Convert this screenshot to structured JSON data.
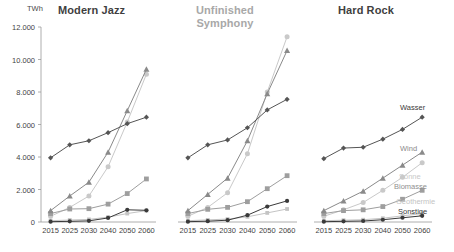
{
  "figure": {
    "unit_label": "TWh",
    "panels": [
      {
        "title": "Modern Jazz",
        "title_color": "#3f3f3f"
      },
      {
        "title": "Unfinished Symphony",
        "title_color": "#a8a8a8"
      },
      {
        "title": "Hard Rock",
        "title_color": "#3f3f3f"
      }
    ]
  },
  "legend": {
    "position": "right-inside",
    "entries": [
      {
        "label": "Wasser",
        "color": "#555555",
        "marker": "diamond"
      },
      {
        "label": "Wind",
        "color": "#8a8a8a",
        "marker": "triangle"
      },
      {
        "label": "Sonne",
        "color": "#c9c9c9",
        "marker": "circle"
      },
      {
        "label": "Biomasse",
        "color": "#9e9e9e",
        "marker": "square"
      },
      {
        "label": "Geothermie",
        "color": "#c4c4c4",
        "marker": "square-small"
      },
      {
        "label": "Sonstige",
        "color": "#3a3a3a",
        "marker": "circle-small"
      }
    ]
  },
  "chart_data": [
    {
      "type": "line",
      "title": "Modern Jazz",
      "xlabel": "",
      "ylabel": "TWh",
      "ylim": [
        0,
        12000
      ],
      "yticks": [
        0,
        2000,
        4000,
        6000,
        8000,
        10000,
        12000
      ],
      "ytick_labels": [
        "0",
        "2.000",
        "4.000",
        "6.000",
        "8.000",
        "10.000",
        "12.000"
      ],
      "categories": [
        "2015",
        "2025",
        "2030",
        "2040",
        "2050",
        "2060"
      ],
      "grid": false,
      "series": [
        {
          "name": "Wasser",
          "values": [
            3950,
            4750,
            5000,
            5500,
            6050,
            6450
          ]
        },
        {
          "name": "Wind",
          "values": [
            700,
            1600,
            2450,
            4300,
            6850,
            9400
          ]
        },
        {
          "name": "Sonne",
          "values": [
            350,
            900,
            1600,
            3400,
            6150,
            9100
          ]
        },
        {
          "name": "Biomasse",
          "values": [
            520,
            800,
            820,
            1100,
            1750,
            2650
          ]
        },
        {
          "name": "Geothermie",
          "values": [
            80,
            120,
            160,
            300,
            520,
            700
          ]
        },
        {
          "name": "Sonstige",
          "values": [
            20,
            40,
            70,
            250,
            750,
            720
          ]
        }
      ]
    },
    {
      "type": "line",
      "title": "Unfinished Symphony",
      "xlabel": "",
      "ylabel": "TWh",
      "ylim": [
        0,
        12000
      ],
      "yticks": [
        0,
        2000,
        4000,
        6000,
        8000,
        10000,
        12000
      ],
      "ytick_labels": [
        "0",
        "2.000",
        "4.000",
        "6.000",
        "8.000",
        "10.000",
        "12.000"
      ],
      "categories": [
        "2015",
        "2025",
        "2030",
        "2040",
        "2050",
        "2060"
      ],
      "grid": false,
      "series": [
        {
          "name": "Wasser",
          "values": [
            3950,
            4750,
            5050,
            5800,
            6900,
            7550
          ]
        },
        {
          "name": "Wind",
          "values": [
            700,
            1700,
            2700,
            5000,
            7900,
            10550
          ]
        },
        {
          "name": "Sonne",
          "values": [
            350,
            900,
            1800,
            4200,
            8000,
            11400
          ]
        },
        {
          "name": "Biomasse",
          "values": [
            520,
            780,
            900,
            1250,
            2050,
            2850
          ]
        },
        {
          "name": "Geothermie",
          "values": [
            80,
            130,
            180,
            320,
            560,
            800
          ]
        },
        {
          "name": "Sonstige",
          "values": [
            20,
            50,
            110,
            420,
            950,
            1300
          ]
        }
      ]
    },
    {
      "type": "line",
      "title": "Hard Rock",
      "xlabel": "",
      "ylabel": "TWh",
      "ylim": [
        0,
        12000
      ],
      "yticks": [
        0,
        2000,
        4000,
        6000,
        8000,
        10000,
        12000
      ],
      "ytick_labels": [
        "0",
        "2.000",
        "4.000",
        "6.000",
        "8.000",
        "10.000",
        "12.000"
      ],
      "categories": [
        "2015",
        "2025",
        "2030",
        "2040",
        "2050",
        "2060"
      ],
      "grid": false,
      "series": [
        {
          "name": "Wasser",
          "values": [
            3900,
            4550,
            4600,
            5100,
            5700,
            6450
          ]
        },
        {
          "name": "Wind",
          "values": [
            700,
            1300,
            1900,
            2700,
            3500,
            4300
          ]
        },
        {
          "name": "Sonne",
          "values": [
            350,
            750,
            1200,
            1950,
            2750,
            3650
          ]
        },
        {
          "name": "Biomasse",
          "values": [
            520,
            700,
            750,
            950,
            1400,
            1950
          ]
        },
        {
          "name": "Geothermie",
          "values": [
            80,
            110,
            140,
            230,
            380,
            520
          ]
        },
        {
          "name": "Sonstige",
          "values": [
            20,
            40,
            60,
            140,
            260,
            380
          ]
        }
      ]
    }
  ]
}
